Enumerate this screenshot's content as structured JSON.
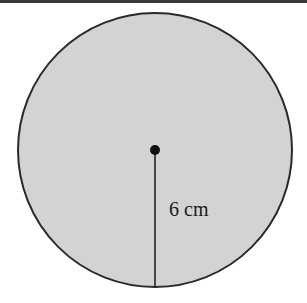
{
  "figure": {
    "shape": "circle",
    "radius_label": "6 cm",
    "fill_color": "#d4d4d4",
    "stroke_color": "#2a2a2a"
  }
}
